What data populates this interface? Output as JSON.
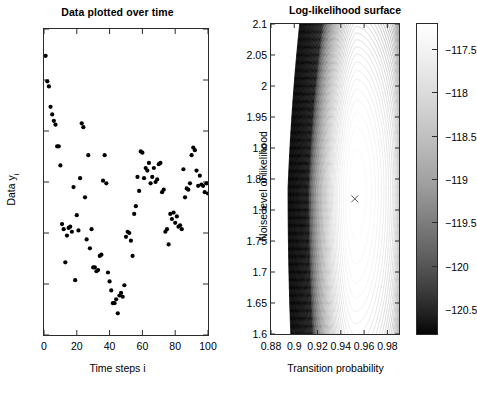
{
  "figure": {
    "width": 470,
    "height": 393,
    "background": "#ffffff",
    "marker_color": "#000000",
    "axis_color": "#2b2b2b"
  },
  "left_panel": {
    "title": "Data plotted over time",
    "xlabel": "Time steps i",
    "ylabel_main": "Data y",
    "ylabel_sub": "i"
  },
  "right_panel": {
    "title": "Log-likelihood surface",
    "xlabel": "Transition probability",
    "ylabel": "Noise level of likelihood",
    "marker_symbol": "×",
    "marker_x": 0.952,
    "marker_y": 1.818
  },
  "colorbar": {
    "ticks": [
      "-117.5",
      "-118",
      "-118.5",
      "-119",
      "-119.5",
      "-120",
      "-120.5"
    ],
    "tick_values": [
      -117.5,
      -118,
      -118.5,
      -119,
      -119.5,
      -120,
      -120.5
    ],
    "min": -120.8,
    "max": -117.2,
    "orientation": "vertical",
    "high_color": "#ffffff",
    "low_color": "#000000"
  },
  "chart_data": [
    {
      "type": "scatter",
      "title": "Data plotted over time",
      "xlabel": "Time steps i",
      "ylabel": "Data y_i",
      "xlim": [
        0,
        100
      ],
      "ylim": [
        -6,
        6
      ],
      "xticks": [
        0,
        20,
        40,
        60,
        80,
        100
      ],
      "yticks": [
        -6,
        -4,
        -2,
        0,
        2,
        4,
        6
      ],
      "grid": false,
      "legend": "none",
      "marker": "filled-circle",
      "x": [
        1,
        2,
        3,
        4,
        5,
        6,
        7,
        8,
        9,
        10,
        11,
        12,
        13,
        14,
        15,
        16,
        17,
        18,
        19,
        20,
        21,
        22,
        23,
        24,
        25,
        26,
        27,
        28,
        29,
        30,
        31,
        32,
        33,
        34,
        35,
        36,
        37,
        38,
        39,
        40,
        41,
        42,
        43,
        44,
        45,
        46,
        47,
        48,
        49,
        50,
        51,
        52,
        53,
        54,
        55,
        56,
        57,
        58,
        59,
        60,
        61,
        62,
        63,
        64,
        65,
        66,
        67,
        68,
        69,
        70,
        71,
        72,
        73,
        74,
        75,
        76,
        77,
        78,
        79,
        80,
        81,
        82,
        83,
        84,
        85,
        86,
        87,
        88,
        89,
        90,
        91,
        92,
        93,
        94,
        95,
        96,
        97,
        98,
        99,
        100
      ],
      "y": [
        4.95,
        3.95,
        3.75,
        2.95,
        2.65,
        2.4,
        2.25,
        1.4,
        1.4,
        0.65,
        -1.65,
        -1.85,
        -3.15,
        -2.1,
        -1.8,
        -1.75,
        -1.95,
        -0.2,
        -3.85,
        -1.3,
        -1.9,
        0.15,
        2.3,
        2.15,
        -0.6,
        -2.25,
        1.05,
        -2.6,
        -1.85,
        -3.35,
        -3.35,
        -3.5,
        -3.45,
        -2.9,
        -2.85,
        0.05,
        1.05,
        -0.05,
        -3.55,
        -3.9,
        -4.25,
        -4.75,
        -4.75,
        -4.6,
        -5.15,
        -4.45,
        -4.35,
        -4.5,
        -4.05,
        -2.15,
        -1.95,
        -2.0,
        -2.3,
        -2.9,
        -1.25,
        -0.95,
        0.2,
        -0.35,
        1.2,
        1.15,
        0.15,
        0.55,
        0.45,
        0.75,
        -0.05,
        0.2,
        0.55,
        0.0,
        0.1,
        0.7,
        0.75,
        -0.4,
        -0.3,
        -1.95,
        -1.85,
        -2.45,
        -1.25,
        -1.45,
        -1.2,
        -1.6,
        -1.35,
        -1.75,
        -1.7,
        -1.85,
        0.5,
        -0.6,
        -0.25,
        -0.3,
        -0.05,
        1.05,
        1.35,
        1.25,
        0.45,
        -0.15,
        0.25,
        -0.1,
        -0.15,
        -0.4,
        -0.05,
        -0.45
      ]
    },
    {
      "type": "contour",
      "title": "Log-likelihood surface",
      "xlabel": "Transition probability",
      "ylabel": "Noise level of likelihood",
      "xlim": [
        0.88,
        0.99
      ],
      "ylim": [
        1.6,
        2.1
      ],
      "xticks": [
        0.88,
        0.9,
        0.92,
        0.94,
        0.96,
        0.98
      ],
      "xticklabels": [
        "0.88",
        "0.9",
        "0.92",
        "0.94",
        "0.96",
        "0.98"
      ],
      "yticks": [
        1.6,
        1.65,
        1.7,
        1.75,
        1.8,
        1.85,
        1.9,
        1.95,
        2,
        2.05,
        2.1
      ],
      "yticklabels": [
        "1.6",
        "1.65",
        "1.7",
        "1.75",
        "1.8",
        "1.85",
        "1.9",
        "1.95",
        "2",
        "2.05",
        "2.1"
      ],
      "zlim": [
        -120.8,
        -117.2
      ],
      "grid": false,
      "colorbar": true,
      "maximum_marker": {
        "x": 0.952,
        "y": 1.818,
        "symbol": "x"
      },
      "description": "Nested contour rings; dense dark contours in upper-left and right edge, light broad maximum near centre-right"
    }
  ]
}
